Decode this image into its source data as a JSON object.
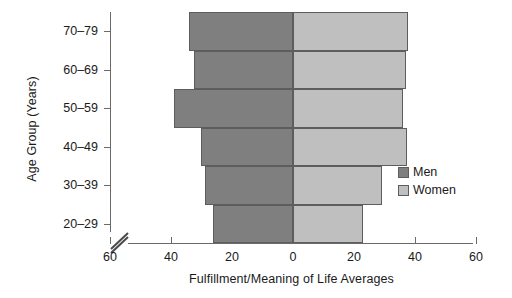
{
  "chart_data": {
    "type": "bar",
    "subtype": "population-pyramid",
    "title": "",
    "xlabel": "Fulfillment/Meaning of Life Averages",
    "ylabel": "Age Group (Years)",
    "categories": [
      "20–29",
      "30–39",
      "40–49",
      "50–59",
      "60–69",
      "70–79"
    ],
    "series": [
      {
        "name": "Men",
        "color": "#7f7f7f",
        "side": "left",
        "values": [
          26.2,
          28.9,
          30.2,
          39.0,
          32.5,
          34.1
        ]
      },
      {
        "name": "Women",
        "color": "#bfbfbf",
        "side": "right",
        "values": [
          23.0,
          29.2,
          37.4,
          36.1,
          37.0,
          37.7
        ]
      }
    ],
    "xlim": [
      -60,
      60
    ],
    "xticks": [
      -60,
      -40,
      -20,
      0,
      20,
      40,
      60
    ],
    "xticklabels": [
      "60",
      "40",
      "20",
      "0",
      "20",
      "40",
      "60"
    ],
    "grid": false,
    "axis_break": true,
    "legend_position": "right-middle"
  },
  "axes": {
    "y_title": "Age Group (Years)",
    "x_title": "Fulfillment/Meaning of Life Averages"
  },
  "legend": {
    "entries": [
      {
        "label": "Men",
        "color": "#7f7f7f"
      },
      {
        "label": "Women",
        "color": "#bfbfbf"
      }
    ]
  },
  "icons": {
    "axis_break": "axis-break-icon"
  }
}
